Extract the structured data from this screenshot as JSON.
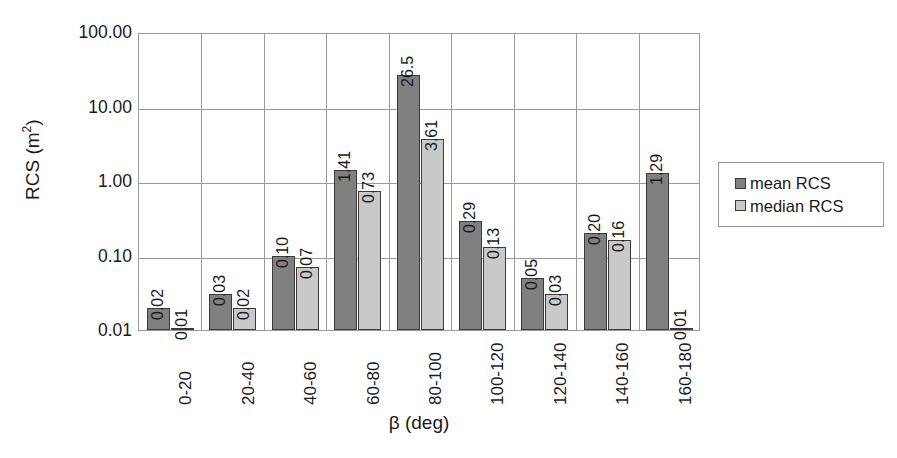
{
  "chart_data": {
    "type": "bar",
    "title": "",
    "xlabel": "β (deg)",
    "ylabel": "RCS (m²)",
    "ylabel_base": "RCS (m",
    "ylabel_sup": "2",
    "ylabel_tail": ")",
    "yscale": "log",
    "ylim": [
      0.01,
      100.0
    ],
    "grid": true,
    "legend_position": "right-outside",
    "y_ticks": [
      "100.00",
      "10.00",
      "1.00",
      "0.10",
      "0.01"
    ],
    "y_tick_values": [
      100.0,
      10.0,
      1.0,
      0.1,
      0.01
    ],
    "categories": [
      "0-20",
      "20-40",
      "40-60",
      "60-80",
      "80-100",
      "100-120",
      "120-140",
      "140-160",
      "160-180"
    ],
    "series": [
      {
        "name": "mean RCS",
        "color": "#808080",
        "values": [
          0.02,
          0.03,
          0.1,
          1.41,
          26.5,
          0.29,
          0.05,
          0.2,
          1.29
        ],
        "labels": [
          "0.02",
          "0.03",
          "0.10",
          "1.41",
          "26.5",
          "0.29",
          "0.05",
          "0.20",
          "1.29"
        ]
      },
      {
        "name": "median RCS",
        "color": "#c9c9c9",
        "values": [
          0.01,
          0.02,
          0.07,
          0.73,
          3.61,
          0.13,
          0.03,
          0.16,
          0.01
        ],
        "labels": [
          "0.01",
          "0.02",
          "0.07",
          "0.73",
          "3.61",
          "0.13",
          "0.03",
          "0.16",
          "0.01"
        ]
      }
    ]
  },
  "legend": {
    "items": [
      {
        "label": "mean RCS",
        "swatch": "mean"
      },
      {
        "label": "median RCS",
        "swatch": "median"
      }
    ]
  },
  "colors": {
    "mean": "#808080",
    "median": "#c9c9c9",
    "axis": "#9a9a9a",
    "bar_border": "#3a3a3a",
    "text": "#1a1a1a",
    "background": "#ffffff"
  }
}
